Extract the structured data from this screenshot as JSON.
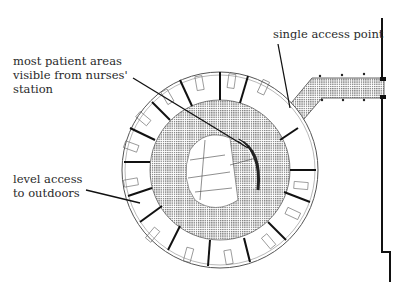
{
  "diagram": {
    "type": "architectural-floor-plan",
    "annotations": [
      {
        "id": "single-access",
        "text": "single access point"
      },
      {
        "id": "visibility",
        "text": "most patient areas\nvisible from nurses'\nstation"
      },
      {
        "id": "outdoors",
        "text": "level access\nto outdoors"
      }
    ],
    "colors": {
      "ink": "#1a1a1a",
      "text": "#2a2a2a",
      "hatch": "#9a9a9a",
      "background": "#ffffff"
    }
  }
}
